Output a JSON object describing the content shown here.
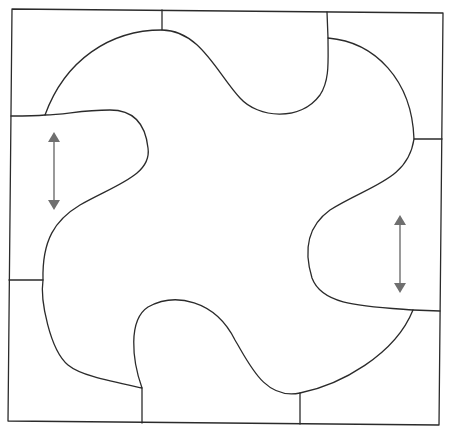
{
  "diagram": {
    "colors": {
      "background": "#ffffff",
      "line": "#2b2b2b",
      "arrow": "#808080"
    },
    "frame_corners": [
      [
        12,
        9
      ],
      [
        443,
        13
      ],
      [
        439,
        425
      ],
      [
        8,
        421
      ]
    ],
    "arrows": [
      {
        "name": "left-double-arrow",
        "x": 54,
        "y1": 132,
        "y2": 210,
        "direction": "vertical-both"
      },
      {
        "name": "right-double-arrow",
        "x": 400,
        "y1": 215,
        "y2": 293,
        "direction": "vertical-both"
      }
    ]
  }
}
